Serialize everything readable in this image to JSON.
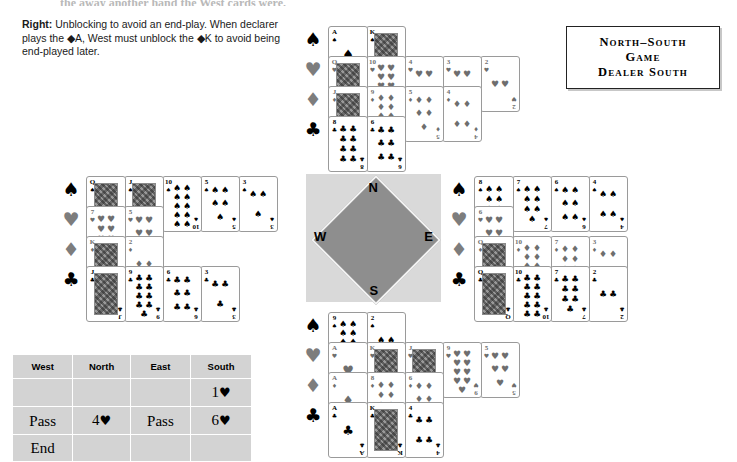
{
  "top_cut_text": "the  away  another  hand  the  West  cards  were.",
  "caption": {
    "lead": "Right:",
    "body": " Unblocking to avoid an end-play. When declarer plays the ◆A, West must unblock the ◆K to avoid being end-played later."
  },
  "vulnerability": {
    "line1": "North–South",
    "line2": "Game",
    "line3": "Dealer South"
  },
  "compass": {
    "north": "N",
    "south": "S",
    "west": "W",
    "east": "E"
  },
  "suit_symbols": {
    "spade": "♠",
    "heart": "♥",
    "diamond": "♦",
    "club": "♣"
  },
  "hands": {
    "north": {
      "label": "North",
      "spades": [
        "A",
        "K"
      ],
      "hearts": [
        "Q",
        "10",
        "4",
        "3",
        "2"
      ],
      "diamonds": [
        "J",
        "9",
        "5",
        "4"
      ],
      "clubs": [
        "8",
        "6"
      ]
    },
    "west": {
      "label": "West",
      "spades": [
        "Q",
        "J",
        "10",
        "5",
        "3"
      ],
      "hearts": [
        "7",
        "5"
      ],
      "diamonds": [
        "K",
        "2"
      ],
      "clubs": [
        "J",
        "9",
        "6",
        "3"
      ]
    },
    "east": {
      "label": "East",
      "spades": [
        "8",
        "7",
        "6",
        "4"
      ],
      "hearts": [
        "6"
      ],
      "diamonds": [
        "Q",
        "10",
        "7",
        "3"
      ],
      "clubs": [
        "Q",
        "10",
        "7",
        "2"
      ]
    },
    "south": {
      "label": "South",
      "spades": [
        "9",
        "2"
      ],
      "hearts": [
        "A",
        "K",
        "J",
        "9",
        "5"
      ],
      "diamonds": [
        "A",
        "8",
        "6"
      ],
      "clubs": [
        "A",
        "K",
        "4"
      ]
    }
  },
  "bidding": {
    "headers": [
      "West",
      "North",
      "East",
      "South"
    ],
    "rows": [
      {
        "west": "",
        "north": "",
        "east": "",
        "south": "1♥"
      },
      {
        "west": "Pass",
        "north": "4♥",
        "east": "Pass",
        "south": "6♥"
      },
      {
        "west": "End",
        "north": "",
        "east": "",
        "south": ""
      }
    ]
  },
  "colors": {
    "table_bg": "#d3d3d3",
    "compass_bg": "#d9d9d9",
    "compass_diamond": "#8e8e8e",
    "red_suit": "#6e6e6e",
    "black_suit": "#000000"
  }
}
